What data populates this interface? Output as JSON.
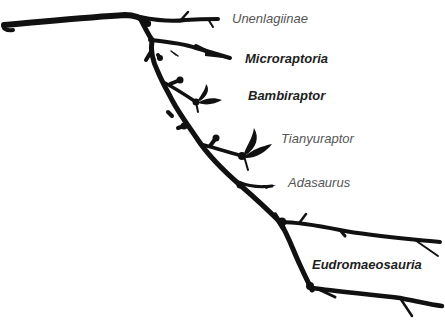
{
  "diagram": {
    "type": "phylogenetic-tree-illustration",
    "style": "tree-branch silhouette",
    "branch_color": "#111111",
    "background": "#ffffff",
    "taxa": [
      {
        "id": "unenlagiinae",
        "label": "Unenlagiinae",
        "emphasis": "normal",
        "color": "#555555"
      },
      {
        "id": "microraptoria",
        "label": "Microraptoria",
        "emphasis": "bold",
        "color": "#1e1e1e"
      },
      {
        "id": "bambiraptor",
        "label": "Bambiraptor",
        "emphasis": "bold",
        "color": "#1e1e1e"
      },
      {
        "id": "tianyuraptor",
        "label": "Tianyuraptor",
        "emphasis": "normal",
        "color": "#555555"
      },
      {
        "id": "adasaurus",
        "label": "Adasaurus",
        "emphasis": "normal",
        "color": "#555555"
      },
      {
        "id": "eudromaeosauria",
        "label": "Eudromaeosauria",
        "emphasis": "bold",
        "color": "#1e1e1e"
      }
    ]
  }
}
